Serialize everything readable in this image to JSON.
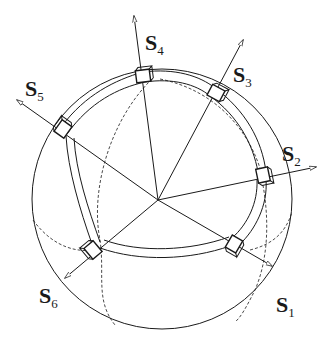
{
  "figure": {
    "center": [
      158,
      200
    ],
    "sphere": {
      "cx": 162,
      "cy": 199,
      "r": 130
    },
    "colors": {
      "stroke": "#1a1a1a",
      "background": "#ffffff"
    },
    "sensors": [
      {
        "id": "S1",
        "letter": "S",
        "index": "1",
        "tip": [
          272,
          266
        ],
        "block": [
          234,
          244
        ],
        "label_pos": [
          276,
          312
        ]
      },
      {
        "id": "S2",
        "letter": "S",
        "index": "2",
        "tip": [
          316,
          167
        ],
        "block": [
          263,
          175
        ],
        "label_pos": [
          282,
          161
        ]
      },
      {
        "id": "S3",
        "letter": "S",
        "index": "3",
        "tip": [
          243,
          40
        ],
        "block": [
          216,
          93
        ],
        "label_pos": [
          233,
          82
        ]
      },
      {
        "id": "S4",
        "letter": "S",
        "index": "4",
        "tip": [
          134,
          16
        ],
        "block": [
          143,
          76
        ],
        "label_pos": [
          145,
          50
        ]
      },
      {
        "id": "S5",
        "letter": "S",
        "index": "5",
        "tip": [
          17,
          100
        ],
        "block": [
          63,
          129
        ],
        "label_pos": [
          25,
          96
        ]
      },
      {
        "id": "S6",
        "letter": "S",
        "index": "6",
        "tip": [
          65,
          278
        ],
        "block": [
          93,
          250
        ],
        "label_pos": [
          39,
          303
        ]
      }
    ]
  }
}
